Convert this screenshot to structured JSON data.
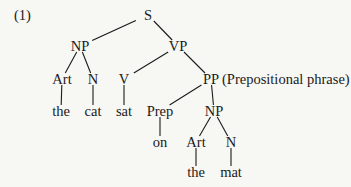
{
  "example_number": "(1)",
  "annotation": "(Prepositional phrase)",
  "tree": {
    "nodes": [
      {
        "id": "S",
        "label": "S"
      },
      {
        "id": "NP1",
        "label": "NP"
      },
      {
        "id": "VP",
        "label": "VP"
      },
      {
        "id": "Art1",
        "label": "Art"
      },
      {
        "id": "N1",
        "label": "N"
      },
      {
        "id": "V",
        "label": "V"
      },
      {
        "id": "PP",
        "label": "PP"
      },
      {
        "id": "the1",
        "label": "the"
      },
      {
        "id": "cat",
        "label": "cat"
      },
      {
        "id": "sat",
        "label": "sat"
      },
      {
        "id": "Prep",
        "label": "Prep"
      },
      {
        "id": "NP2",
        "label": "NP"
      },
      {
        "id": "on",
        "label": "on"
      },
      {
        "id": "Art2",
        "label": "Art"
      },
      {
        "id": "N2",
        "label": "N"
      },
      {
        "id": "the2",
        "label": "the"
      },
      {
        "id": "mat",
        "label": "mat"
      }
    ],
    "edges": [
      [
        "S",
        "NP1"
      ],
      [
        "S",
        "VP"
      ],
      [
        "NP1",
        "Art1"
      ],
      [
        "NP1",
        "N1"
      ],
      [
        "VP",
        "V"
      ],
      [
        "VP",
        "PP"
      ],
      [
        "Art1",
        "the1"
      ],
      [
        "N1",
        "cat"
      ],
      [
        "V",
        "sat"
      ],
      [
        "PP",
        "Prep"
      ],
      [
        "PP",
        "NP2"
      ],
      [
        "Prep",
        "on"
      ],
      [
        "NP2",
        "Art2"
      ],
      [
        "NP2",
        "N2"
      ],
      [
        "Art2",
        "the2"
      ],
      [
        "N2",
        "mat"
      ]
    ]
  }
}
